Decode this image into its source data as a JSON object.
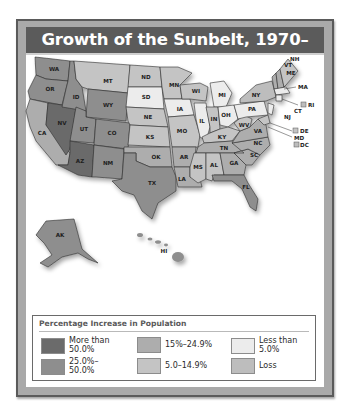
{
  "title": "Growth of the Sunbelt, 1970–1980",
  "colors": {
    "more_than_50": "#6b6b6b",
    "25_to_50": "#8e8e8e",
    "15_to_24_9": "#adadad",
    "5_to_14_9": "#c4c4c4",
    "less_than_5": "#ececec",
    "loss": "#bdbdbd",
    "frame": "#5a5a5a",
    "title_bar": "#5b5b5b"
  },
  "map": {
    "states": {
      "WA": "25.0%–50.0%",
      "OR": "25.0%–50.0%",
      "CA": "15%–24.9%",
      "NV": "More than 50.0%",
      "ID": "25.0%–50.0%",
      "MT": "5.0–14.9%",
      "WY": "25.0%–50.0%",
      "UT": "25.0%–50.0%",
      "CO": "25.0%–50.0%",
      "AZ": "More than 50.0%",
      "NM": "25.0%–50.0%",
      "ND": "5.0–14.9%",
      "SD": "Less than 5.0%",
      "NE": "5.0–14.9%",
      "KS": "5.0–14.9%",
      "OK": "15%–24.9%",
      "TX": "25.0%–50.0%",
      "MN": "5.0–14.9%",
      "IA": "Less than 5.0%",
      "MO": "5.0–14.9%",
      "AR": "15%–24.9%",
      "LA": "15%–24.9%",
      "WI": "5.0–14.9%",
      "IL": "Less than 5.0%",
      "MI": "Less than 5.0%",
      "IN": "5.0–14.9%",
      "OH": "Less than 5.0%",
      "KY": "5.0–14.9%",
      "TN": "15%–24.9%",
      "MS": "5.0–14.9%",
      "AL": "5.0–14.9%",
      "GA": "15%–24.9%",
      "FL": "25.0%–50.0%",
      "SC": "15%–24.9%",
      "NC": "15%–24.9%",
      "VA": "15%–24.9%",
      "WV": "5.0–14.9%",
      "PA": "Less than 5.0%",
      "NY": "Loss",
      "VT": "15%–24.9%",
      "NH": "15%–24.9%",
      "ME": "5.0–14.9%",
      "MA": "Less than 5.0%",
      "RI": "Loss",
      "CT": "Less than 5.0%",
      "NJ": "Less than 5.0%",
      "DE": "5.0–14.9%",
      "MD": "5.0–14.9%",
      "DC": "Loss",
      "AK": "25.0%–50.0%",
      "HI": "25.0%–50.0%"
    },
    "labels": [
      "WA",
      "OR",
      "CA",
      "NV",
      "ID",
      "MT",
      "WY",
      "UT",
      "CO",
      "AZ",
      "NM",
      "ND",
      "SD",
      "NE",
      "KS",
      "OK",
      "TX",
      "MN",
      "IA",
      "MO",
      "AR",
      "LA",
      "WI",
      "IL",
      "MI",
      "IN",
      "OH",
      "KY",
      "TN",
      "MS",
      "AL",
      "GA",
      "FL",
      "SC",
      "NC",
      "VA",
      "WV",
      "PA",
      "NY",
      "NH",
      "VT",
      "ME",
      "MA",
      "RI",
      "CT",
      "NJ",
      "DE",
      "MD",
      "DC",
      "AK",
      "HI"
    ]
  },
  "legend": {
    "title": "Percentage Increase in Population",
    "items": [
      {
        "label": "More than\n50.0%",
        "key": "more_than_50"
      },
      {
        "label": "25.0%–\n50.0%",
        "key": "25_to_50"
      },
      {
        "label": "15%–24.9%",
        "key": "15_to_24_9"
      },
      {
        "label": "5.0–14.9%",
        "key": "5_to_14_9"
      },
      {
        "label": "Less than\n5.0%",
        "key": "less_than_5"
      },
      {
        "label": "Loss",
        "key": "loss"
      }
    ]
  }
}
